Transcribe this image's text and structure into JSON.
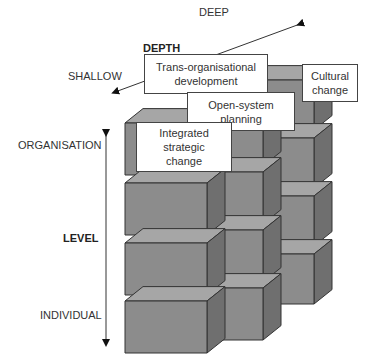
{
  "depth_axis": {
    "title": "DEPTH",
    "shallow_label": "SHALLOW",
    "deep_label": "DEEP"
  },
  "level_axis": {
    "title": "LEVEL",
    "top_label": "ORGANISATION",
    "bottom_label": "INDIVIDUAL"
  },
  "interventions": [
    {
      "label": "Trans-organisational development"
    },
    {
      "label": "Cultural change"
    },
    {
      "label": "Open-system planning"
    },
    {
      "label": "Integrated strategic change"
    }
  ],
  "colors": {
    "cube_front": "#8c8c8c",
    "cube_top": "#a6a6a6",
    "cube_side": "#6f6f6f",
    "outline": "#333333"
  }
}
